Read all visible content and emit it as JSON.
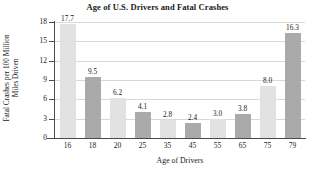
{
  "chart_data": {
    "type": "bar",
    "title": "Age of U.S. Drivers and Fatal Crashes",
    "xlabel": "Age of Drivers",
    "ylabel_line1": "Fatal Crashes per 100 Million",
    "ylabel_line2": "Miles Driven",
    "categories": [
      "16",
      "18",
      "20",
      "25",
      "35",
      "45",
      "55",
      "65",
      "75",
      "79"
    ],
    "values": [
      17.7,
      9.5,
      6.2,
      4.1,
      2.8,
      2.4,
      3.0,
      3.8,
      8.0,
      16.3
    ],
    "value_labels": [
      "17.7",
      "9.5",
      "6.2",
      "4.1",
      "2.8",
      "2.4",
      "3.0",
      "3.8",
      "8.0",
      "16.3"
    ],
    "ylim": [
      0,
      18
    ],
    "yticks": [
      0,
      3,
      6,
      9,
      12,
      15,
      18
    ],
    "ytick_labels": [
      "0",
      "3",
      "6",
      "9",
      "12",
      "15",
      "18"
    ],
    "grid": true,
    "legend": "none",
    "bar_colors": [
      "#e2e2e2",
      "#aaaaaa"
    ],
    "axis_color": "#4a4a4a",
    "gridline_color": "#d8d8d8",
    "background": "#ffffff"
  }
}
